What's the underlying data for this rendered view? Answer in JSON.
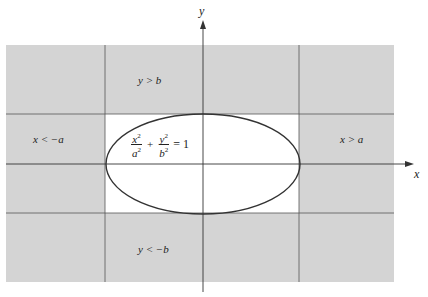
{
  "figure": {
    "axes": {
      "x_label": "x",
      "y_label": "y"
    },
    "regions": {
      "top": "y > b",
      "bottom": "y < −b",
      "left": "x < −a",
      "right": "x > a"
    },
    "equation": {
      "x_num": "x",
      "x_den": "a",
      "y_num": "y",
      "y_den": "b",
      "exp": "2",
      "plus": "+",
      "rhs": "= 1"
    },
    "colors": {
      "shaded": "#d4d4d4",
      "unshaded": "#ffffff",
      "lines": "#444444",
      "ellipse": "#333333"
    }
  }
}
